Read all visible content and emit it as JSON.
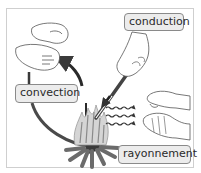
{
  "diagram": {
    "labels": {
      "conduction": "conduction",
      "convection": "convection",
      "rayonnement": "rayonnement"
    },
    "elements": [
      {
        "id": "campfire",
        "icon": "campfire-icon"
      },
      {
        "id": "hands-above-fire",
        "icon": "hands-icon",
        "relates_to": "convection"
      },
      {
        "id": "hand-holding-rod",
        "icon": "hand-rod-icon",
        "relates_to": "conduction"
      },
      {
        "id": "hands-beside-fire",
        "icon": "hands-icon",
        "relates_to": "rayonnement"
      },
      {
        "id": "convection-loop-arrow",
        "icon": "curved-arrow-icon"
      },
      {
        "id": "radiation-waves",
        "icon": "wavy-arrows-icon",
        "count": 3
      }
    ],
    "colors": {
      "stroke": "#333333",
      "arrow": "#3a3a3a",
      "label_bg": "#ececec",
      "label_border": "#8a8a8a",
      "flame": "#bdbdbd",
      "logs": "#6b6b6b",
      "frame": "#cfcfcf"
    }
  }
}
